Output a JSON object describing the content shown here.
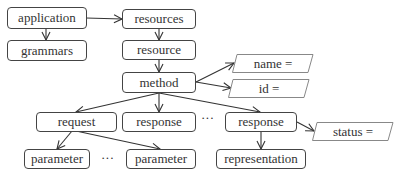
{
  "nodes": {
    "application": "application",
    "grammars": "grammars",
    "resources": "resources",
    "resource": "resource",
    "method": "method",
    "request": "request",
    "response_middle": "response",
    "response_right": "response",
    "parameter_left": "parameter",
    "parameter_right": "parameter",
    "representation": "representation"
  },
  "attributes": {
    "name": "name =",
    "id": "id =",
    "status": "status ="
  },
  "ellipses": {
    "responses": "···",
    "parameters": "···"
  },
  "colors": {
    "stroke": "#444444",
    "attr_stroke": "#888888",
    "text": "#333333"
  }
}
